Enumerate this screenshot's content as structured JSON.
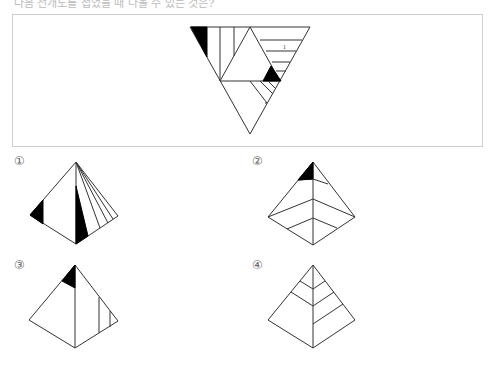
{
  "question": {
    "header_text": "다음 전개도를 접었을 때 나올 수 있는 것은?",
    "header_visible": "partially cut off at top"
  },
  "net": {
    "description": "Triangular net of a triangular pyramid (tetrahedron): large inverted triangle divided into 4 faces with stripe patterns and black shaded regions",
    "faces": [
      "top-left face: vertical stripes with black corner triangle",
      "center face: blank",
      "top-right face: horizontal stripes with black small triangle",
      "bottom face: diagonal stripes near top-right edge"
    ]
  },
  "options": [
    {
      "label": "①",
      "description": "pyramid with two black triangles and diagonal stripes on right face"
    },
    {
      "label": "②",
      "description": "pyramid with black apex region and nested chevron lines on lower faces"
    },
    {
      "label": "③",
      "description": "pyramid with black apex region and two vertical stripes on right face"
    },
    {
      "label": "④",
      "description": "pyramid with chevron lines on both faces, no black region"
    }
  ],
  "colors": {
    "line": "#333333",
    "fill": "#000000",
    "box_border": "#cfcfcf"
  }
}
